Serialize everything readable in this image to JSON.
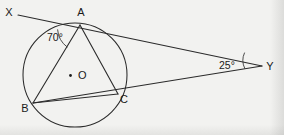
{
  "figure": {
    "type": "geometry-diagram",
    "background_color": "#f2f2f0",
    "ink_color": "#2b2b2b",
    "canvas": {
      "width": 284,
      "height": 135
    }
  },
  "circle": {
    "label": "O",
    "centre_label": "O",
    "centre": {
      "x": 75,
      "y": 75
    },
    "radius": 52,
    "has_centre_dot": true
  },
  "points": [
    {
      "name": "X",
      "label": "X",
      "x": 18,
      "y": 15,
      "label_x": 9,
      "label_y": 16
    },
    {
      "name": "A",
      "label": "A",
      "x": 80,
      "y": 25,
      "label_x": 81,
      "label_y": 16
    },
    {
      "name": "B",
      "label": "B",
      "x": 33,
      "y": 103,
      "label_x": 25,
      "label_y": 112
    },
    {
      "name": "C",
      "label": "C",
      "x": 118,
      "y": 94,
      "label_x": 124,
      "label_y": 103
    },
    {
      "name": "O",
      "label": "O",
      "x": 75,
      "y": 75,
      "label_x": 78,
      "label_y": 79
    },
    {
      "name": "Y",
      "label": "Y",
      "x": 262,
      "y": 66,
      "label_x": 270,
      "label_y": 70
    }
  ],
  "segments": [
    {
      "name": "tangent-XAY",
      "from": "X",
      "to": "Y",
      "through": "A",
      "is_tangent": true
    },
    {
      "name": "secant-BCY",
      "from": "B",
      "to": "Y",
      "through": "C",
      "is_secant": true
    },
    {
      "name": "chord-AB",
      "from": "A",
      "to": "B"
    },
    {
      "name": "chord-AC",
      "from": "A",
      "to": "C"
    },
    {
      "name": "chord-BC",
      "from": "B",
      "to": "C"
    }
  ],
  "angles": [
    {
      "name": "angle-XAB",
      "vertex": "A",
      "value": "70°",
      "value_number": 70,
      "label_x": 47,
      "label_y": 41,
      "marker": "arc"
    },
    {
      "name": "angle-AYB",
      "vertex": "Y",
      "value": "25°",
      "value_number": 25,
      "label_x": 219,
      "label_y": 69,
      "marker": "arc"
    }
  ]
}
